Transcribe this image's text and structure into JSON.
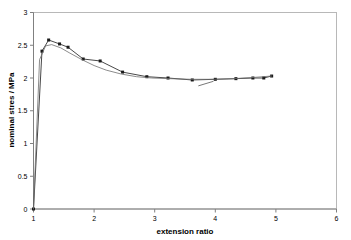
{
  "chart_data": {
    "type": "line",
    "title": "",
    "xlabel": "extension ratio",
    "ylabel": "nominal stres / MPa",
    "xlim": [
      1,
      6
    ],
    "ylim": [
      0,
      3
    ],
    "xticks": [
      "1",
      "2",
      "3",
      "4",
      "5",
      "6"
    ],
    "yticks": [
      "0",
      "0.5",
      "1",
      "1.5",
      "2",
      "2.5",
      "3"
    ],
    "grid": false,
    "legend": "none",
    "series": [
      {
        "name": "measured (markers)",
        "marker": "square",
        "color": "#1a1a1a",
        "x": [
          1.0,
          1.14,
          1.25,
          1.43,
          1.57,
          1.82,
          2.1,
          2.47,
          2.87,
          3.22,
          3.62,
          4.0,
          4.34,
          4.62,
          4.8,
          4.93
        ],
        "y": [
          0.0,
          2.41,
          2.58,
          2.52,
          2.47,
          2.29,
          2.26,
          2.09,
          2.02,
          2.0,
          1.97,
          1.98,
          1.99,
          2.0,
          2.0,
          2.03
        ]
      },
      {
        "name": "model (smooth)",
        "marker": "none",
        "color": "#6e6e6e",
        "x": [
          1.0,
          1.1,
          1.2,
          1.3,
          1.45,
          1.6,
          1.8,
          2.0,
          2.2,
          2.45,
          2.7,
          2.95,
          3.25,
          3.6,
          3.95,
          4.3,
          4.65,
          4.93
        ],
        "y": [
          0.0,
          2.28,
          2.49,
          2.51,
          2.46,
          2.38,
          2.28,
          2.19,
          2.12,
          2.06,
          2.02,
          2.0,
          1.99,
          1.98,
          1.98,
          1.99,
          2.01,
          2.03
        ]
      }
    ],
    "annotations": [
      {
        "name": "tangent-tick",
        "x_start": 3.72,
        "y_start": 1.88,
        "x_end": 3.97,
        "y_end": 1.95
      }
    ]
  }
}
